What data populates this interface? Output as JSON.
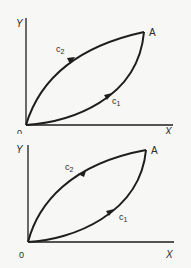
{
  "diagrams": [
    {
      "id": "top",
      "axes": {
        "y_label": "Y",
        "x_label": "X",
        "origin_label": "0"
      },
      "point_label": "A",
      "curves": [
        {
          "name": "c2",
          "label_main": "c",
          "label_sub": "2",
          "position": "upper",
          "direction": "O to A"
        },
        {
          "name": "c1",
          "label_main": "c",
          "label_sub": "1",
          "position": "lower",
          "direction": "O to A"
        }
      ]
    },
    {
      "id": "bottom",
      "axes": {
        "y_label": "Y",
        "x_label": "X",
        "origin_label": "0"
      },
      "point_label": "A",
      "curves": [
        {
          "name": "c2",
          "label_main": "c",
          "label_sub": "2",
          "position": "upper",
          "direction": "A to O"
        },
        {
          "name": "c1",
          "label_main": "c",
          "label_sub": "1",
          "position": "lower",
          "direction": "O to A"
        }
      ]
    }
  ],
  "colors": {
    "line": "#1e1e1e",
    "background": "#f7f7f5",
    "text": "#2a2a2a"
  }
}
